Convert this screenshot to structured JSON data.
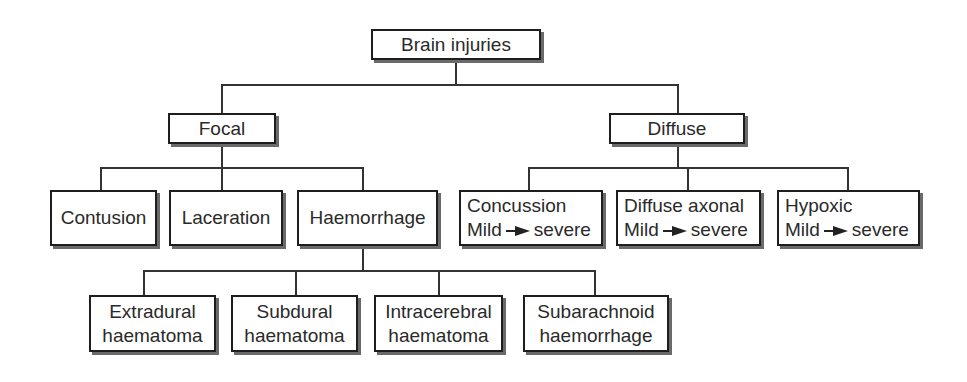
{
  "diagram": {
    "root": {
      "label": "Brain injuries"
    },
    "categories": [
      {
        "label": "Focal",
        "children": [
          {
            "label": "Contusion"
          },
          {
            "label": "Laceration"
          },
          {
            "label": "Haemorrhage",
            "children": [
              {
                "line1": "Extradural",
                "line2": "haematoma"
              },
              {
                "line1": "Subdural",
                "line2": "haematoma"
              },
              {
                "line1": "Intracerebral",
                "line2": "haematoma"
              },
              {
                "line1": "Subarachnoid",
                "line2": "haemorrhage"
              }
            ]
          }
        ]
      },
      {
        "label": "Diffuse",
        "children": [
          {
            "line1": "Concussion",
            "from": "Mild",
            "to": "severe",
            "arrow_icon": "right-arrow"
          },
          {
            "line1": "Diffuse axonal",
            "from": "Mild",
            "to": "severe",
            "arrow_icon": "right-arrow"
          },
          {
            "line1": "Hypoxic",
            "from": "Mild",
            "to": "severe",
            "arrow_icon": "right-arrow"
          }
        ]
      }
    ]
  }
}
